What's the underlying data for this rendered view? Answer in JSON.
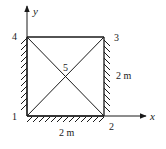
{
  "diagram": {
    "type": "truss-structure",
    "axes": {
      "x_label": "x",
      "y_label": "y"
    },
    "nodes": [
      {
        "id": "1",
        "label": "1",
        "position": "bottom-left"
      },
      {
        "id": "2",
        "label": "2",
        "position": "bottom-right"
      },
      {
        "id": "3",
        "label": "3",
        "position": "top-right"
      },
      {
        "id": "4",
        "label": "4",
        "position": "top-left"
      },
      {
        "id": "5",
        "label": "5",
        "position": "center"
      }
    ],
    "members": [
      {
        "from": "1",
        "to": "2"
      },
      {
        "from": "2",
        "to": "3"
      },
      {
        "from": "3",
        "to": "4"
      },
      {
        "from": "4",
        "to": "1"
      },
      {
        "from": "1",
        "to": "3"
      },
      {
        "from": "2",
        "to": "4"
      }
    ],
    "supports": [
      {
        "side": "left",
        "description": "fixed wall along edge 1-4"
      },
      {
        "side": "bottom",
        "description": "fixed ground along edge 1-2"
      },
      {
        "side": "right",
        "description": "fixed wall along edge 2-3"
      }
    ],
    "dimensions": {
      "width_label": "2 m",
      "height_label": "2 m"
    },
    "colors": {
      "line": "#1a1a1a",
      "background": "#ffffff"
    }
  }
}
